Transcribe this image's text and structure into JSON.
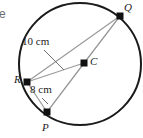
{
  "figure": {
    "type": "circle-geometry-diagram",
    "edge_fragment_text": "e",
    "circle": {
      "center_label": "C",
      "cx": 80,
      "cy": 64,
      "r": 61,
      "stroke": "#1a1a1a",
      "stroke_width": 2
    },
    "points": [
      {
        "id": "Q",
        "label": "Q",
        "x": 120,
        "y": 16,
        "label_x": 124,
        "label_y": 2
      },
      {
        "id": "C",
        "label": "C",
        "x": 84,
        "y": 63,
        "label_x": 90,
        "label_y": 56
      },
      {
        "id": "R",
        "label": "R",
        "x": 27,
        "y": 82,
        "label_x": 14,
        "label_y": 74
      },
      {
        "id": "P",
        "label": "P",
        "x": 47,
        "y": 112,
        "label_x": 42,
        "label_y": 122
      }
    ],
    "segments": [
      {
        "from": "R",
        "to": "Q",
        "stroke": "#9a9a9a"
      },
      {
        "from": "R",
        "to": "C",
        "stroke": "#9a9a9a"
      },
      {
        "from": "C",
        "to": "Q",
        "stroke": "#9a9a9a"
      },
      {
        "from": "R",
        "to": "P",
        "stroke": "#9a9a9a"
      },
      {
        "from": "P",
        "to": "C",
        "stroke": "#9a9a9a"
      },
      {
        "from": "P",
        "to": "Q",
        "stroke": "#9a9a9a"
      }
    ],
    "measures": [
      {
        "id": "chord-RQ",
        "text": "10 cm",
        "label_x": 22,
        "label_y": 36,
        "leader": {
          "x1": 44,
          "y1": 50,
          "x2": 64,
          "y2": 70
        }
      },
      {
        "id": "chord-RP",
        "text": "8 cm",
        "label_x": 30,
        "label_y": 84,
        "leader": {
          "x1": 42,
          "y1": 98,
          "x2": 48,
          "y2": 104
        }
      }
    ],
    "colors": {
      "circle_stroke": "#1a1a1a",
      "chord_stroke": "#9a9a9a",
      "point_fill": "#111111",
      "text": "#1c1c1c",
      "background": "#ffffff"
    }
  }
}
